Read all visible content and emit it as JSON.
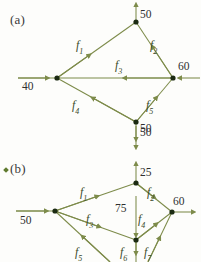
{
  "figure": {
    "panels": [
      {
        "id": "a",
        "label": "(a)",
        "label_pos": {
          "x": 10,
          "y": 12
        },
        "nodes": [
          {
            "name": "node-a-top",
            "x": 136,
            "y": 22
          },
          {
            "name": "node-a-left",
            "x": 57,
            "y": 78
          },
          {
            "name": "node-a-right",
            "x": 173,
            "y": 78
          },
          {
            "name": "node-a-bottom",
            "x": 136,
            "y": 122
          }
        ],
        "external_values": [
          {
            "name": "external-supply-top",
            "text": "50",
            "x": 140,
            "y": 8,
            "direction": "up"
          },
          {
            "name": "external-supply-left",
            "text": "40",
            "x": 26,
            "y": 82,
            "direction": "right"
          },
          {
            "name": "external-demand-right",
            "text": "60",
            "x": 177,
            "y": 62,
            "direction": "left"
          },
          {
            "name": "external-demand-bottom",
            "text": "50",
            "x": 140,
            "y": 123,
            "direction": "down"
          }
        ],
        "flow_labels": [
          {
            "name": "flow-label-f1",
            "base": "f",
            "sub": "1",
            "x": 79,
            "y": 42
          },
          {
            "name": "flow-label-f2",
            "base": "f",
            "sub": "2",
            "x": 151,
            "y": 42
          },
          {
            "name": "flow-label-f3",
            "base": "f",
            "sub": "3",
            "x": 117,
            "y": 63
          },
          {
            "name": "flow-label-f4",
            "base": "f",
            "sub": "4",
            "x": 74,
            "y": 101
          },
          {
            "name": "flow-label-f5",
            "base": "f",
            "sub": "5",
            "x": 147,
            "y": 101
          }
        ]
      },
      {
        "id": "b",
        "label": "(b)",
        "label_pos": {
          "x": 10,
          "y": 162
        },
        "bullet_pos": {
          "x": 4,
          "y": 169
        },
        "nodes": [
          {
            "name": "node-b-top",
            "x": 136,
            "y": 183
          },
          {
            "name": "node-b-left",
            "x": 55,
            "y": 211
          },
          {
            "name": "node-b-right",
            "x": 172,
            "y": 212
          },
          {
            "name": "node-b-middle",
            "x": 136,
            "y": 240
          }
        ],
        "external_values": [
          {
            "name": "external-demand-top-outer",
            "text": "50",
            "x": 140,
            "y": 128,
            "direction": "down"
          },
          {
            "name": "external-supply-top-inner",
            "text": "25",
            "x": 140,
            "y": 167,
            "direction": "up"
          },
          {
            "name": "external-supply-left",
            "text": "50",
            "x": 24,
            "y": 215,
            "direction": "right"
          },
          {
            "name": "external-demand-right",
            "text": "60",
            "x": 176,
            "y": 197,
            "direction": "right"
          },
          {
            "name": "external-flow-middle",
            "text": "75",
            "x": 118,
            "y": 204,
            "direction": "down"
          }
        ],
        "flow_labels": [
          {
            "name": "flow-label-f1",
            "base": "f",
            "sub": "1",
            "x": 82,
            "y": 188
          },
          {
            "name": "flow-label-f2",
            "base": "f",
            "sub": "2",
            "x": 148,
            "y": 188
          },
          {
            "name": "flow-label-f3",
            "base": "f",
            "sub": "3",
            "x": 88,
            "y": 215
          },
          {
            "name": "flow-label-f4",
            "base": "f",
            "sub": "4",
            "x": 139,
            "y": 215
          },
          {
            "name": "flow-label-f5",
            "base": "f",
            "sub": "5",
            "x": 77,
            "y": 248
          },
          {
            "name": "flow-label-f6",
            "base": "f",
            "sub": "6",
            "x": 122,
            "y": 248
          },
          {
            "name": "flow-label-f7",
            "base": "f",
            "sub": "7",
            "x": 145,
            "y": 248
          }
        ]
      }
    ],
    "colors": {
      "edge": "#7d8b4a",
      "node": "#1b2a12",
      "flow_text": "#41522c",
      "value_text": "#2f2f2f",
      "panel_text": "#3a3a3a",
      "background": "#fdfdfb"
    }
  }
}
